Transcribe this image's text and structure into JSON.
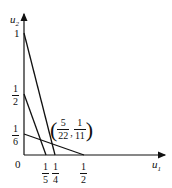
{
  "axes": {
    "x_label": "u",
    "x_sub": "1",
    "y_label": "u",
    "y_sub": "2",
    "origin": "0"
  },
  "y_ticks": [
    {
      "label": "1"
    },
    {
      "num": "1",
      "den": "2"
    },
    {
      "num": "1",
      "den": "6"
    }
  ],
  "x_ticks": [
    {
      "num": "1",
      "den": "5"
    },
    {
      "num": "1",
      "den": "4"
    },
    {
      "num": "1",
      "den": "2"
    }
  ],
  "point": {
    "x_num": "5",
    "x_den": "22",
    "y_num": "1",
    "y_den": "11",
    "sep": ","
  },
  "lines": [
    {
      "from": [
        0,
        1
      ],
      "to": [
        0.25,
        0
      ]
    },
    {
      "from": [
        0,
        0.5
      ],
      "to": [
        0.2,
        0
      ]
    },
    {
      "from": [
        0,
        0.1667
      ],
      "to": [
        0.5,
        0
      ]
    }
  ]
}
